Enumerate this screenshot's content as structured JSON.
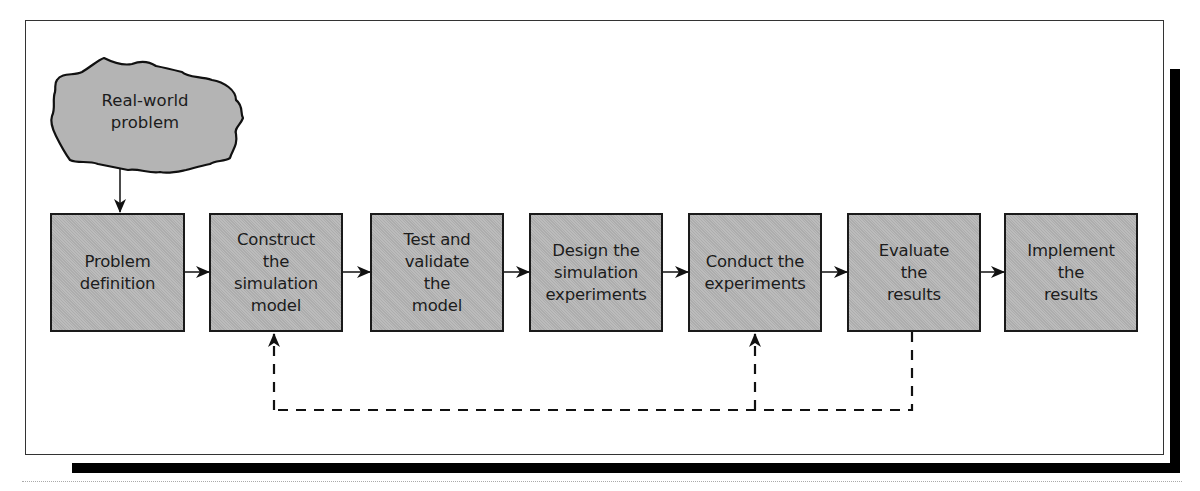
{
  "diagram": {
    "type": "flowchart",
    "start_node": {
      "id": "real-world-problem",
      "label": "Real-world\nproblem",
      "shape": "cloud"
    },
    "steps": [
      {
        "id": "problem-definition",
        "label": "Problem\ndefinition"
      },
      {
        "id": "construct-model",
        "label": "Construct\nthe\nsimulation\nmodel"
      },
      {
        "id": "test-validate",
        "label": "Test and\nvalidate\nthe\nmodel"
      },
      {
        "id": "design-experiments",
        "label": "Design the\nsimulation\nexperiments"
      },
      {
        "id": "conduct-experiments",
        "label": "Conduct the\nexperiments"
      },
      {
        "id": "evaluate-results",
        "label": "Evaluate\nthe\nresults"
      },
      {
        "id": "implement-results",
        "label": "Implement\nthe\nresults"
      }
    ],
    "edges": [
      {
        "from": "real-world-problem",
        "to": "problem-definition",
        "style": "solid"
      },
      {
        "from": "problem-definition",
        "to": "construct-model",
        "style": "solid"
      },
      {
        "from": "construct-model",
        "to": "test-validate",
        "style": "solid"
      },
      {
        "from": "test-validate",
        "to": "design-experiments",
        "style": "solid"
      },
      {
        "from": "design-experiments",
        "to": "conduct-experiments",
        "style": "solid"
      },
      {
        "from": "conduct-experiments",
        "to": "evaluate-results",
        "style": "solid"
      },
      {
        "from": "evaluate-results",
        "to": "implement-results",
        "style": "solid"
      },
      {
        "from": "evaluate-results",
        "to": "construct-model",
        "style": "dashed",
        "label": "feedback"
      },
      {
        "from": "evaluate-results",
        "to": "conduct-experiments",
        "style": "dashed",
        "label": "feedback"
      }
    ],
    "colors": {
      "box_fill": "#b4b4b4",
      "border": "#1a1a1a",
      "shadow": "#000000"
    }
  }
}
